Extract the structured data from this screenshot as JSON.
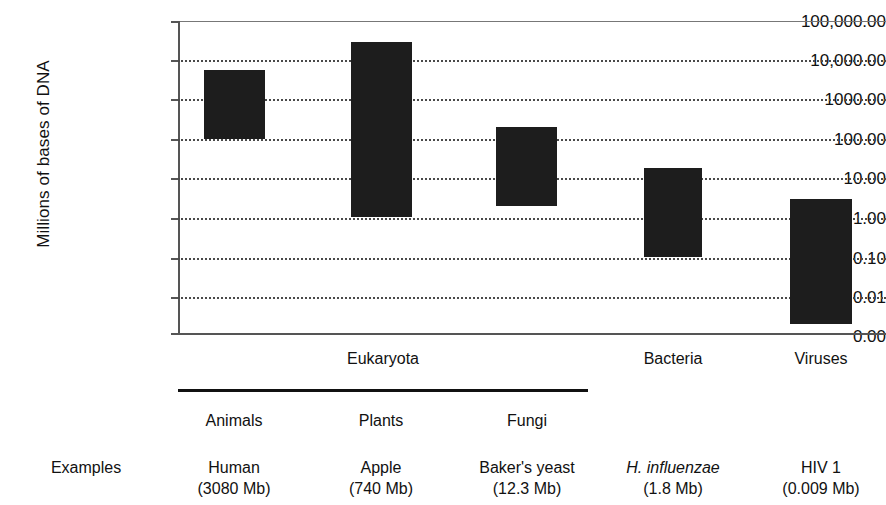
{
  "chart_data": {
    "type": "bar",
    "title": "",
    "xlabel": "",
    "ylabel": "Millions of bases of DNA",
    "y_scale": "log",
    "ylim": [
      0.0,
      100000.0
    ],
    "grid": true,
    "legend": "none",
    "ytick_labels": [
      "100,000.00",
      "10,000.00",
      "1000.00",
      "100.00",
      "10.00",
      "1.00",
      "0.10",
      "0.01",
      "0.00"
    ],
    "ytick_values": [
      100000,
      10000,
      1000,
      100,
      10,
      1,
      0.1,
      0.01,
      0
    ],
    "categories": [
      "Animals",
      "Plants",
      "Fungi",
      "Bacteria",
      "Viruses"
    ],
    "bar_style": "floating range bars (min to max genome size)",
    "series": [
      {
        "name": "range low",
        "values": [
          100,
          1.0,
          2.0,
          0.1,
          0.002
        ]
      },
      {
        "name": "range high",
        "values": [
          5600,
          30000,
          200,
          18,
          3.0
        ]
      }
    ],
    "bars": [
      {
        "category": "Animals",
        "low": 100,
        "high": 5600
      },
      {
        "category": "Plants",
        "low": 1.0,
        "high": 30000
      },
      {
        "category": "Fungi",
        "low": 2.0,
        "high": 200
      },
      {
        "category": "Bacteria",
        "low": 0.1,
        "high": 18
      },
      {
        "category": "Viruses",
        "low": 0.002,
        "high": 3.0
      }
    ],
    "domain_groups": [
      {
        "label": "Eukaryota",
        "categories": [
          "Animals",
          "Plants",
          "Fungi"
        ],
        "underlined": true
      },
      {
        "label": "Bacteria",
        "categories": [
          "Bacteria"
        ],
        "underlined": false
      },
      {
        "label": "Viruses",
        "categories": [
          "Viruses"
        ],
        "underlined": false
      }
    ],
    "examples_row_label": "Examples",
    "examples": [
      {
        "name": "Human",
        "size": "(3080 Mb)",
        "italic": false
      },
      {
        "name": "Apple",
        "size": "(740 Mb)",
        "italic": false
      },
      {
        "name": "Baker's yeast",
        "size": "(12.3 Mb)",
        "italic": false
      },
      {
        "name": "H. influenzae",
        "size": "(1.8 Mb)",
        "italic": true
      },
      {
        "name": "HIV 1",
        "size": "(0.009 Mb)",
        "italic": false
      }
    ],
    "colors": {
      "bar": "#1d1d1d",
      "grid": "#4a4a4a",
      "axis": "#555555",
      "text": "#111111"
    }
  },
  "axis": {
    "y_title": "Millions of bases of DNA",
    "ticks": [
      {
        "label": "100,000.00"
      },
      {
        "label": "10,000.00"
      },
      {
        "label": "1000.00"
      },
      {
        "label": "100.00"
      },
      {
        "label": "10.00"
      },
      {
        "label": "1.00"
      },
      {
        "label": "0.10"
      },
      {
        "label": "0.01"
      },
      {
        "label": "0.00"
      }
    ]
  },
  "groups": [
    {
      "label": "Eukaryota"
    },
    {
      "label": "Bacteria"
    },
    {
      "label": "Viruses"
    }
  ],
  "categories": [
    {
      "label": "Animals"
    },
    {
      "label": "Plants"
    },
    {
      "label": "Fungi"
    }
  ],
  "examples": {
    "row_label": "Examples",
    "cells": [
      {
        "name": "Human",
        "size": "(3080 Mb)"
      },
      {
        "name": "Apple",
        "size": "(740 Mb)"
      },
      {
        "name": "Baker's yeast",
        "size": "(12.3 Mb)"
      },
      {
        "name": "H. influenzae",
        "size": "(1.8 Mb)"
      },
      {
        "name": "HIV 1",
        "size": "(0.009 Mb)"
      }
    ]
  }
}
